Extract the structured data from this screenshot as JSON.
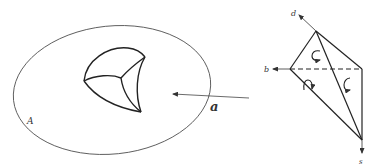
{
  "diagram": {
    "left_figure": {
      "region_label": "A",
      "description": "closed ellipse containing a curved cusp-shaped solid with three faces meeting at a vertex"
    },
    "arrow": {
      "label": "a",
      "direction": "leftward, pointing into region A"
    },
    "right_figure": {
      "description": "tetrahedron with oriented faces",
      "axis_labels": {
        "top": "d",
        "left": "b",
        "bottom": "s"
      },
      "face_orientation_marks": [
        "clockwise-arrow",
        "counterclockwise-arrow",
        "clockwise-arrow"
      ],
      "hidden_edge": "dashed"
    },
    "colors": {
      "stroke": "#222222",
      "thin_stroke": "#555555",
      "background": "#ffffff"
    }
  }
}
